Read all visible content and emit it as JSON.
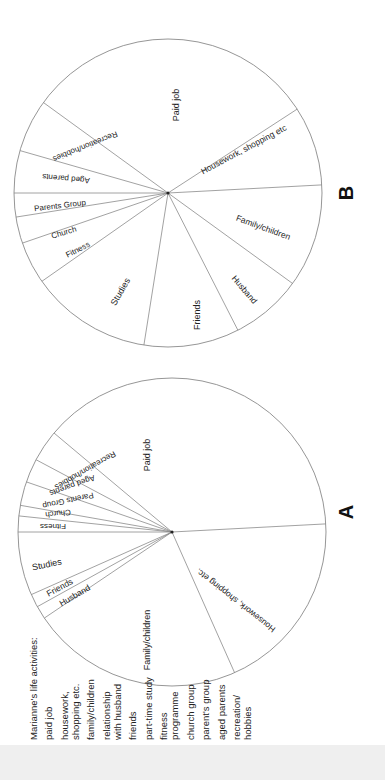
{
  "figure": {
    "orientation": "rotated 90 degrees counter-clockwise",
    "legend": {
      "title": "Marianne's life activities:",
      "items": [
        "paid job",
        "housework,\nshopping etc.",
        "family/children",
        "relationship\nwith husband",
        "friends",
        "part-time study",
        "fitness\nprogramme",
        "church group",
        "parent's group",
        "aged parents",
        "recreation/\nhobbies"
      ]
    },
    "pie_a": {
      "letter": "A",
      "center": [
        172,
        532
      ],
      "radius": 154,
      "boundaries_deg": [
        -3,
        66,
        146,
        151,
        156,
        180,
        186,
        190,
        199,
        208,
        220
      ],
      "labels": [
        {
          "text": "Paid job",
          "x": 148,
          "y": 455,
          "rot": -90,
          "size": 9
        },
        {
          "text": "Housework, shopping etc.",
          "x": 236,
          "y": 600,
          "rot": -142,
          "size": 8.5
        },
        {
          "text": "Family/children",
          "x": 148,
          "y": 640,
          "rot": -90,
          "size": 9
        },
        {
          "text": "Husband",
          "x": 75,
          "y": 596,
          "rot": -30,
          "size": 8.5
        },
        {
          "text": "Friends",
          "x": 60,
          "y": 588,
          "rot": -28,
          "size": 8.5
        },
        {
          "text": "Studies",
          "x": 47,
          "y": 565,
          "rot": -12,
          "size": 9
        },
        {
          "text": "Fitness",
          "x": 53,
          "y": 526,
          "rot": 180,
          "size": 8
        },
        {
          "text": "Church",
          "x": 58,
          "y": 513,
          "rot": 174,
          "size": 8
        },
        {
          "text": "Parents Group",
          "x": 68,
          "y": 500,
          "rot": 168,
          "size": 8
        },
        {
          "text": "Aged parents",
          "x": 72,
          "y": 485,
          "rot": 160,
          "size": 8
        },
        {
          "text": "Recreation/hobbies",
          "x": 85,
          "y": 470,
          "rot": 150,
          "size": 8
        }
      ]
    },
    "pie_b": {
      "letter": "B",
      "center": [
        168,
        193
      ],
      "radius": 154,
      "boundaries_deg": [
        -33,
        -3,
        36,
        63,
        99,
        145,
        161,
        171,
        180,
        196,
        216
      ],
      "labels": [
        {
          "text": "Paid job",
          "x": 177,
          "y": 105,
          "rot": -90,
          "size": 9
        },
        {
          "text": "Housework, shopping etc",
          "x": 244,
          "y": 150,
          "rot": -28,
          "size": 8.5
        },
        {
          "text": "Family/children",
          "x": 263,
          "y": 228,
          "rot": 20,
          "size": 8.5
        },
        {
          "text": "Husband",
          "x": 244,
          "y": 290,
          "rot": 50,
          "size": 8.5
        },
        {
          "text": "Friends",
          "x": 198,
          "y": 315,
          "rot": -90,
          "size": 9
        },
        {
          "text": "Studies",
          "x": 121,
          "y": 292,
          "rot": -60,
          "size": 9
        },
        {
          "text": "Fitness",
          "x": 78,
          "y": 250,
          "rot": -27,
          "size": 8
        },
        {
          "text": "Church",
          "x": 64,
          "y": 233,
          "rot": -17,
          "size": 8
        },
        {
          "text": "Parents Group",
          "x": 60,
          "y": 206,
          "rot": -7,
          "size": 8
        },
        {
          "text": "Aged parents",
          "x": 66,
          "y": 178,
          "rot": 185,
          "size": 8
        },
        {
          "text": "Recreation/hobbies",
          "x": 85,
          "y": 146,
          "rot": 158,
          "size": 8
        }
      ]
    }
  },
  "chart_data": [
    {
      "type": "pie",
      "title": "A",
      "categories": [
        "Paid job",
        "Housework, shopping etc.",
        "Family/children",
        "Husband",
        "Friends",
        "Studies",
        "Fitness",
        "Church",
        "Parents Group",
        "Aged parents",
        "Recreation/hobbies"
      ],
      "values": [
        36,
        19,
        22,
        1.5,
        1.5,
        6.5,
        1.5,
        1.2,
        2.5,
        2.5,
        3.3
      ],
      "unit": "approx. % of circle"
    },
    {
      "type": "pie",
      "title": "B",
      "categories": [
        "Paid job",
        "Housework, shopping etc",
        "Family/children",
        "Husband",
        "Friends",
        "Studies",
        "Fitness",
        "Church",
        "Parents Group",
        "Aged parents",
        "Recreation/hobbies"
      ],
      "values": [
        19,
        8.5,
        11,
        7.5,
        10,
        12.8,
        4.4,
        2.8,
        2.5,
        4.4,
        5.6
      ],
      "unit": "approx. % of circle"
    }
  ]
}
